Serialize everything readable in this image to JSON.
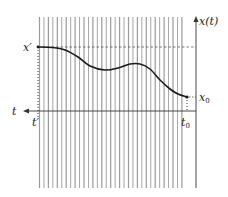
{
  "diagram": {
    "type": "trajectory-plot",
    "labels": {
      "x_axis_label": "t",
      "y_axis_label": "x(t)",
      "x_prime": "x′",
      "t_prime": "t′",
      "x_zero": "x",
      "x_zero_sub": "0",
      "t_zero": "t",
      "t_zero_sub": "0"
    },
    "colors": {
      "grid_lines": "#8a8a8a",
      "curve": "#1a1a1a",
      "axis": "#333333",
      "dashed": "#555555"
    },
    "vertical_lines": {
      "count": 33,
      "x_start": 39.5,
      "spacing": 4.45,
      "y_top": 17,
      "y_bottom": 188
    },
    "curve_points": [
      [
        38,
        47
      ],
      [
        52,
        47.5
      ],
      [
        65,
        50
      ],
      [
        78,
        57
      ],
      [
        90,
        66
      ],
      [
        105,
        70
      ],
      [
        118,
        68
      ],
      [
        130,
        64
      ],
      [
        140,
        64
      ],
      [
        150,
        69
      ],
      [
        160,
        80
      ],
      [
        170,
        89
      ],
      [
        178,
        94
      ],
      [
        187,
        97
      ]
    ]
  }
}
